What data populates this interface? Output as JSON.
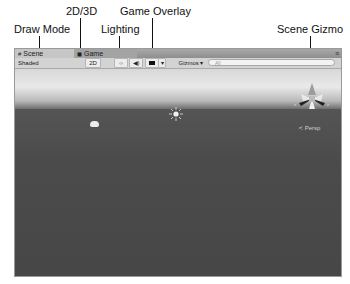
{
  "callouts": {
    "draw_mode": "Draw Mode",
    "two_d_three_d": "2D/3D",
    "lighting": "Lighting",
    "game_overlay": "Game Overlay",
    "scene_gizmo": "Scene Gizmo"
  },
  "tabs": [
    {
      "label": "Scene",
      "icon": "scene-grid-icon",
      "active": true
    },
    {
      "label": "Game",
      "icon": "game-pacman-icon",
      "active": false
    }
  ],
  "toolbar": {
    "draw_mode": "Shaded",
    "two_d_label": "2D",
    "lighting_icon": "sun-icon",
    "audio_icon": "speaker-icon",
    "overlay_icon": "image-icon",
    "overlay_dropdown": "▾",
    "gizmos_label": "Gizmos ▾",
    "search_placeholder": "All"
  },
  "viewport": {
    "projection_label": "≺ Persp",
    "gizmo_axes": {
      "x": "x",
      "z": "z"
    }
  },
  "colors": {
    "sky": "#e0e0e0",
    "ground": "#4a4a4a",
    "toolbar": "#d3d3d3",
    "gizmo_y": "#a0a0a0"
  }
}
